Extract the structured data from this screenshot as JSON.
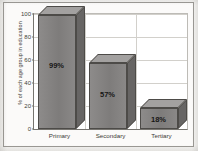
{
  "chart_data": {
    "type": "bar",
    "title": "",
    "subtitle": "",
    "xlabel": "",
    "ylabel": "% of each age group in education",
    "categories": [
      "Primary",
      "Secondary",
      "Tertiary"
    ],
    "values": [
      99,
      57,
      18
    ],
    "data_labels": [
      "99%",
      "57%",
      "18%"
    ],
    "ylim": [
      0,
      100
    ],
    "yticks": [
      0,
      20,
      40,
      60,
      80,
      100
    ],
    "ytick_labels": [
      "0",
      "20",
      "40",
      "60",
      "80",
      "100"
    ],
    "grid": true,
    "legend": false,
    "style_3d": true,
    "colors": {
      "bar_front": "#838181",
      "bar_top": "#a3a1a0",
      "bar_side": "#676564",
      "bar_outline": "#4d4b48",
      "gridline": "#d2d0cb",
      "axis": "#76746f",
      "plot_background": "#ffffff",
      "page_background": "#fbfaf9",
      "label_text": "#171615"
    }
  }
}
